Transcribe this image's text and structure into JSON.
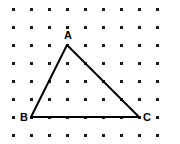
{
  "figure": {
    "canvas": {
      "width": 180,
      "height": 144,
      "background": "#ffffff"
    },
    "grid": {
      "name": "dot-lattice",
      "columns": 9,
      "rows": 8,
      "spacing_px": 18,
      "origin_x": 13,
      "origin_y": 9,
      "dot_size_px": 3,
      "dot_color": "#1a1a1a"
    },
    "shape": {
      "type": "triangle",
      "stroke_color": "#000000",
      "stroke_width_px": 2,
      "fill": "none",
      "vertices": [
        {
          "label": "A",
          "x": 67,
          "y": 45,
          "grid_col": 4,
          "grid_row": 3,
          "label_x": 68,
          "label_y": 39,
          "label_anchor": "middle"
        },
        {
          "label": "B",
          "x": 31,
          "y": 117,
          "grid_col": 2,
          "grid_row": 7,
          "label_x": 24,
          "label_y": 121,
          "label_anchor": "middle"
        },
        {
          "label": "C",
          "x": 139,
          "y": 117,
          "grid_col": 8,
          "grid_row": 7,
          "label_x": 147,
          "label_y": 121,
          "label_anchor": "middle"
        }
      ],
      "edges": [
        {
          "name": "edge-AB",
          "from": "A",
          "to": "B"
        },
        {
          "name": "edge-BC",
          "from": "B",
          "to": "C"
        },
        {
          "name": "edge-CA",
          "from": "C",
          "to": "A"
        }
      ]
    }
  }
}
